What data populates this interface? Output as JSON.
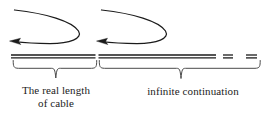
{
  "figure": {
    "background_color": "#ffffff",
    "ink_color": "#1b1b1b",
    "width": 272,
    "height": 118
  },
  "labels": {
    "real_length_line1": "The real length",
    "real_length_line2": "of cable",
    "infinite": "infinite continuation"
  },
  "annotations": {
    "arrow_left_name": "curved return arrow over real cable",
    "arrow_right_name": "curved return arrow over infinite cable",
    "brace_left_name": "underbrace spanning the real cable",
    "brace_right_name": "underbrace spanning the infinite continuation",
    "cable_left_name": "real cable double line",
    "cable_right_name": "infinite cable double line",
    "dash_1_name": "continuation dash one",
    "dash_2_name": "continuation dash two"
  }
}
